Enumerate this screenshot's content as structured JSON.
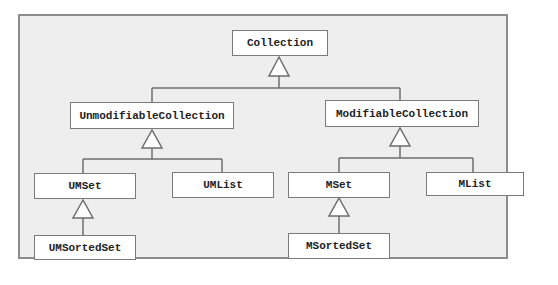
{
  "diagram": {
    "type": "class-hierarchy",
    "colors": {
      "frame_fill": "#eeeeee",
      "frame_border": "#8c8c8c",
      "box_fill": "#ffffff",
      "box_border": "#7a7a7a",
      "line": "#6e6e6e",
      "text": "#222222"
    },
    "nodes": {
      "collection": "Collection",
      "unmodifiable_collection": "UnmodifiableCollection",
      "modifiable_collection": "ModifiableCollection",
      "umset": "UMSet",
      "umlist": "UMList",
      "mset": "MSet",
      "mlist": "MList",
      "umsortedset": "UMSortedSet",
      "msortedset": "MSortedSet"
    },
    "edges": [
      {
        "child": "UnmodifiableCollection",
        "parent": "Collection",
        "kind": "inheritance"
      },
      {
        "child": "ModifiableCollection",
        "parent": "Collection",
        "kind": "inheritance"
      },
      {
        "child": "UMSet",
        "parent": "UnmodifiableCollection",
        "kind": "inheritance"
      },
      {
        "child": "UMList",
        "parent": "UnmodifiableCollection",
        "kind": "inheritance"
      },
      {
        "child": "MSet",
        "parent": "ModifiableCollection",
        "kind": "inheritance"
      },
      {
        "child": "MList",
        "parent": "ModifiableCollection",
        "kind": "inheritance"
      },
      {
        "child": "UMSortedSet",
        "parent": "UMSet",
        "kind": "inheritance"
      },
      {
        "child": "MSortedSet",
        "parent": "MSet",
        "kind": "inheritance"
      }
    ]
  }
}
